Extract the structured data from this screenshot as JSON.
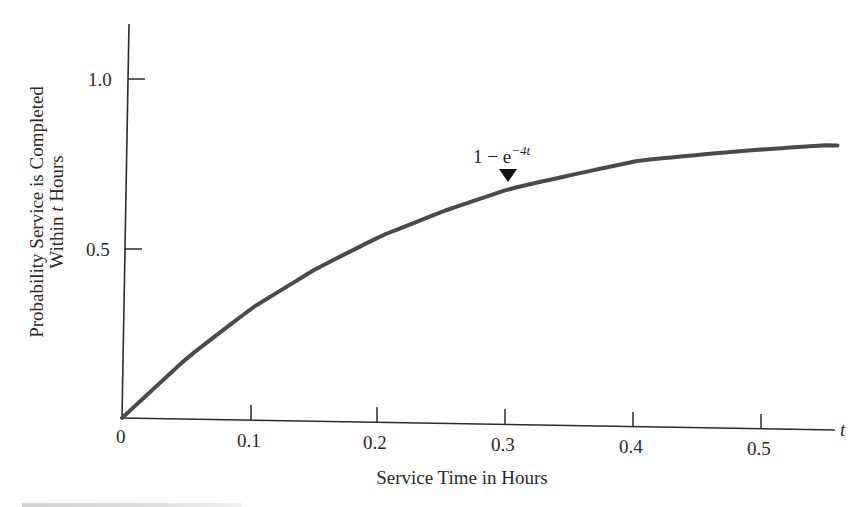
{
  "chart_data": {
    "type": "line",
    "title": "",
    "xlabel": "Service Time in Hours",
    "xlabel_variable": "t",
    "ylabel_line1": "Probability Service is Completed",
    "ylabel_line2_prefix": "Within ",
    "ylabel_line2_var": "t",
    "ylabel_line2_suffix": " Hours",
    "xlim": [
      0,
      0.56
    ],
    "ylim": [
      0,
      1.15
    ],
    "x_ticks": [
      0.1,
      0.2,
      0.3,
      0.4,
      0.5
    ],
    "x_tick_labels": [
      "0",
      "0.1",
      "0.2",
      "0.3",
      "0.4",
      "0.5"
    ],
    "y_ticks": [
      0.5,
      1.0
    ],
    "y_tick_labels": [
      "0.5",
      "1.0"
    ],
    "grid": false,
    "legend": null,
    "series": [
      {
        "name": "1 - e^(-4t)",
        "function": "1 - exp(-4t)",
        "color": "#4a4a4a",
        "x": [
          0,
          0.05,
          0.1,
          0.15,
          0.2,
          0.25,
          0.3,
          0.35,
          0.4,
          0.45,
          0.5,
          0.55
        ],
        "y": [
          0,
          0.18,
          0.33,
          0.45,
          0.55,
          0.63,
          0.7,
          0.75,
          0.8,
          0.83,
          0.86,
          0.89
        ]
      }
    ],
    "annotations": [
      {
        "text_main": "1 − e",
        "text_sup": "−4t",
        "x": 0.3,
        "y": 0.7,
        "marker": "down-triangle"
      }
    ]
  }
}
